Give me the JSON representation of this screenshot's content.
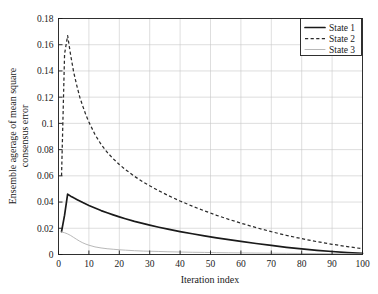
{
  "chart_data": {
    "type": "line",
    "title": "",
    "xlabel": "Iteration index",
    "ylabel": "Ensemble agerage of mean square consensus error",
    "ylabel_line1": "Ensemble agerage of mean square",
    "ylabel_line2": "consensus error",
    "xlim": [
      0,
      100
    ],
    "ylim": [
      0,
      0.18
    ],
    "xticks": [
      0,
      10,
      20,
      30,
      40,
      50,
      60,
      70,
      80,
      90,
      100
    ],
    "xtick_labels": [
      "0",
      "10",
      "20",
      "30",
      "40",
      "50",
      "60",
      "70",
      "80",
      "90",
      "100"
    ],
    "yticks": [
      0,
      0.02,
      0.04,
      0.06,
      0.08,
      0.1,
      0.12,
      0.14,
      0.16,
      0.18
    ],
    "ytick_labels": [
      "0",
      "0.02",
      "0.04",
      "0.06",
      "0.08",
      "0.1",
      "0.12",
      "0.14",
      "0.16",
      "0.18"
    ],
    "grid": true,
    "legend_position": "top-right",
    "x": [
      1,
      2,
      3,
      4,
      5,
      6,
      7,
      8,
      9,
      10,
      12,
      14,
      16,
      18,
      20,
      22,
      25,
      28,
      30,
      33,
      36,
      40,
      44,
      48,
      52,
      56,
      60,
      65,
      70,
      75,
      80,
      85,
      90,
      95,
      100
    ],
    "series": [
      {
        "name": "State 1",
        "style": "solid",
        "color": "#1a1a1a",
        "values": [
          0.0175,
          0.03,
          0.046,
          0.0445,
          0.0432,
          0.042,
          0.0408,
          0.0396,
          0.0385,
          0.0374,
          0.0354,
          0.0335,
          0.0318,
          0.0302,
          0.0287,
          0.0273,
          0.0253,
          0.0235,
          0.0224,
          0.0208,
          0.0193,
          0.0175,
          0.0158,
          0.0142,
          0.0127,
          0.0113,
          0.01,
          0.0084,
          0.0069,
          0.0055,
          0.0043,
          0.0032,
          0.0023,
          0.0015,
          0.0008
        ]
      },
      {
        "name": "State 2",
        "style": "dashed",
        "color": "#2b2b2b",
        "values": [
          0.06,
          0.153,
          0.167,
          0.152,
          0.139,
          0.129,
          0.12,
          0.113,
          0.1065,
          0.101,
          0.0915,
          0.084,
          0.078,
          0.073,
          0.0687,
          0.0648,
          0.0596,
          0.0551,
          0.0524,
          0.0486,
          0.0451,
          0.0408,
          0.0369,
          0.0333,
          0.0299,
          0.0268,
          0.0239,
          0.0205,
          0.0174,
          0.0146,
          0.0121,
          0.0098,
          0.0078,
          0.006,
          0.0044
        ]
      },
      {
        "name": "State 3",
        "style": "thin-solid",
        "color": "#b0b0b0",
        "values": [
          0.0172,
          0.0166,
          0.0157,
          0.0145,
          0.013,
          0.0115,
          0.0101,
          0.0089,
          0.0079,
          0.0071,
          0.0058,
          0.005,
          0.0044,
          0.004,
          0.0036,
          0.0033,
          0.0029,
          0.0026,
          0.0025,
          0.0023,
          0.0021,
          0.0019,
          0.0017,
          0.0016,
          0.0014,
          0.0013,
          0.0012,
          0.0011,
          0.001,
          0.0009,
          0.0008,
          0.0007,
          0.0006,
          0.0005,
          0.0004
        ]
      }
    ]
  },
  "colors": {
    "axis": "#1a1a1a",
    "grid": "#c8c8c8",
    "background": "#ffffff",
    "series1": "#1a1a1a",
    "series2": "#2b2b2b",
    "series3": "#b0b0b0"
  }
}
